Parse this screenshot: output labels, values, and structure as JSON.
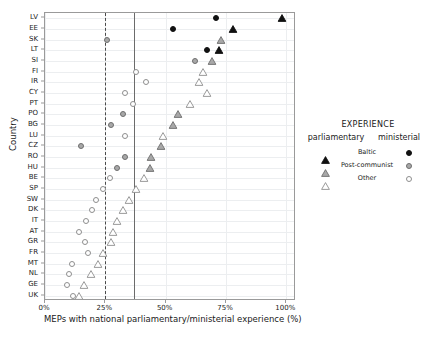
{
  "chart_data": {
    "type": "scatter",
    "title": "",
    "xlabel": "MEPs with national parliamentary/ministerial experience (%)",
    "ylabel": "Country",
    "xlim": [
      0,
      104
    ],
    "xticks": [
      "0%",
      "25%",
      "50%",
      "75%",
      "100%"
    ],
    "xtickvalues": [
      0,
      25,
      50,
      75,
      100
    ],
    "grid": true,
    "legend": {
      "title": "EXPERIENCE",
      "col_parliamentary": "parliamentary",
      "col_ministerial": "ministerial",
      "rows": [
        {
          "label": "Baltic",
          "marker_fill": "#111111",
          "marker_stroke": "#111111"
        },
        {
          "label": "Post-communist",
          "marker_fill": "#a8a8a8",
          "marker_stroke": "#6e6e6e"
        },
        {
          "label": "Other",
          "marker_fill": "#ffffff",
          "marker_stroke": "#8e8e8e"
        }
      ]
    },
    "reference_lines": [
      {
        "value": 25.0,
        "style": "dashed",
        "color": "#4a4a4a"
      },
      {
        "value": 37.0,
        "style": "solid",
        "color": "#6b6b6b"
      }
    ],
    "categories": [
      "LV",
      "EE",
      "SK",
      "LT",
      "SI",
      "FI",
      "IR",
      "CY",
      "PT",
      "PO",
      "BG",
      "LU",
      "CZ",
      "RO",
      "HU",
      "BE",
      "SP",
      "SW",
      "DK",
      "IT",
      "AT",
      "GR",
      "FR",
      "MT",
      "NL",
      "GE",
      "UK"
    ],
    "series": [
      {
        "name": "ministerial",
        "marker": "circle",
        "points": [
          {
            "country": "LV",
            "value": 71.0,
            "group": "Baltic"
          },
          {
            "country": "EE",
            "value": 53.0,
            "group": "Baltic"
          },
          {
            "country": "SK",
            "value": 25.5,
            "group": "Post-communist"
          },
          {
            "country": "LT",
            "value": 67.0,
            "group": "Baltic"
          },
          {
            "country": "SI",
            "value": 62.0,
            "group": "Post-communist"
          },
          {
            "country": "FI",
            "value": 37.5,
            "group": "Other"
          },
          {
            "country": "IR",
            "value": 42.0,
            "group": "Other"
          },
          {
            "country": "CY",
            "value": 33.0,
            "group": "Other"
          },
          {
            "country": "PT",
            "value": 36.5,
            "group": "Other"
          },
          {
            "country": "PO",
            "value": 32.5,
            "group": "Post-communist"
          },
          {
            "country": "BG",
            "value": 27.5,
            "group": "Post-communist"
          },
          {
            "country": "LU",
            "value": 33.0,
            "group": "Other"
          },
          {
            "country": "CZ",
            "value": 15.0,
            "group": "Post-communist"
          },
          {
            "country": "RO",
            "value": 33.0,
            "group": "Post-communist"
          },
          {
            "country": "HU",
            "value": 30.0,
            "group": "Post-communist"
          },
          {
            "country": "BE",
            "value": 27.0,
            "group": "Other"
          },
          {
            "country": "SP",
            "value": 24.0,
            "group": "Other"
          },
          {
            "country": "SW",
            "value": 21.0,
            "group": "Other"
          },
          {
            "country": "DK",
            "value": 19.5,
            "group": "Other"
          },
          {
            "country": "IT",
            "value": 17.0,
            "group": "Other"
          },
          {
            "country": "AT",
            "value": 14.0,
            "group": "Other"
          },
          {
            "country": "GR",
            "value": 16.5,
            "group": "Other"
          },
          {
            "country": "FR",
            "value": 18.0,
            "group": "Other"
          },
          {
            "country": "MT",
            "value": 11.0,
            "group": "Other"
          },
          {
            "country": "NL",
            "value": 10.0,
            "group": "Other"
          },
          {
            "country": "GE",
            "value": 9.0,
            "group": "Other"
          },
          {
            "country": "UK",
            "value": 11.5,
            "group": "Other"
          }
        ]
      },
      {
        "name": "parliamentary",
        "marker": "triangle",
        "points": [
          {
            "country": "LV",
            "value": 98.0,
            "group": "Baltic"
          },
          {
            "country": "EE",
            "value": 78.0,
            "group": "Baltic"
          },
          {
            "country": "SK",
            "value": 73.0,
            "group": "Post-communist"
          },
          {
            "country": "LT",
            "value": 72.0,
            "group": "Baltic"
          },
          {
            "country": "SI",
            "value": 69.0,
            "group": "Post-communist"
          },
          {
            "country": "FI",
            "value": 65.5,
            "group": "Other"
          },
          {
            "country": "IR",
            "value": 64.0,
            "group": "Other"
          },
          {
            "country": "CY",
            "value": 67.0,
            "group": "Other"
          },
          {
            "country": "PT",
            "value": 60.0,
            "group": "Other"
          },
          {
            "country": "PO",
            "value": 55.0,
            "group": "Post-communist"
          },
          {
            "country": "BG",
            "value": 53.0,
            "group": "Post-communist"
          },
          {
            "country": "LU",
            "value": 49.0,
            "group": "Other"
          },
          {
            "country": "CZ",
            "value": 48.0,
            "group": "Post-communist"
          },
          {
            "country": "RO",
            "value": 44.0,
            "group": "Post-communist"
          },
          {
            "country": "HU",
            "value": 43.5,
            "group": "Post-communist"
          },
          {
            "country": "BE",
            "value": 41.0,
            "group": "Other"
          },
          {
            "country": "SP",
            "value": 37.5,
            "group": "Other"
          },
          {
            "country": "SW",
            "value": 35.0,
            "group": "Other"
          },
          {
            "country": "DK",
            "value": 32.5,
            "group": "Other"
          },
          {
            "country": "IT",
            "value": 30.0,
            "group": "Other"
          },
          {
            "country": "AT",
            "value": 28.0,
            "group": "Other"
          },
          {
            "country": "GR",
            "value": 27.5,
            "group": "Other"
          },
          {
            "country": "FR",
            "value": 24.0,
            "group": "Other"
          },
          {
            "country": "MT",
            "value": 22.0,
            "group": "Other"
          },
          {
            "country": "NL",
            "value": 19.0,
            "group": "Other"
          },
          {
            "country": "GE",
            "value": 16.0,
            "group": "Other"
          },
          {
            "country": "UK",
            "value": 14.0,
            "group": "Other"
          }
        ]
      }
    ]
  }
}
